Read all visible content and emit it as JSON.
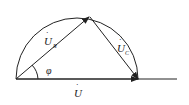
{
  "diagram": {
    "title": "",
    "labels": {
      "u_r": {
        "main": "U",
        "sub": "R",
        "dot": "·"
      },
      "u_c": {
        "main": "U",
        "sub": "C",
        "dot": "·"
      },
      "u": {
        "main": "U",
        "dot": "·"
      },
      "phi": "φ"
    },
    "colors": {
      "stroke": "#222222",
      "background": "#ffffff"
    }
  }
}
